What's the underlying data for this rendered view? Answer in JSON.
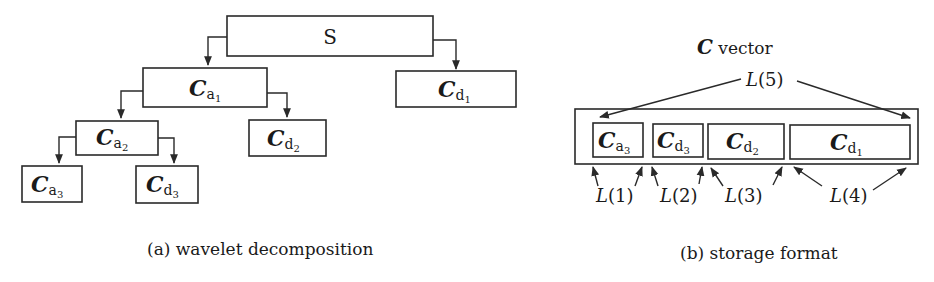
{
  "figure": {
    "panel_a": {
      "caption": "(a) wavelet decomposition",
      "nodes": [
        {
          "id": "S",
          "label": "S"
        },
        {
          "id": "Ca1",
          "sym": "C",
          "base": "a",
          "index": "1"
        },
        {
          "id": "Cd1",
          "sym": "C",
          "base": "d",
          "index": "1"
        },
        {
          "id": "Ca2",
          "sym": "C",
          "base": "a",
          "index": "2"
        },
        {
          "id": "Cd2",
          "sym": "C",
          "base": "d",
          "index": "2"
        },
        {
          "id": "Ca3",
          "sym": "C",
          "base": "a",
          "index": "3"
        },
        {
          "id": "Cd3",
          "sym": "C",
          "base": "d",
          "index": "3"
        }
      ],
      "edges": [
        [
          "S",
          "Ca1"
        ],
        [
          "S",
          "Cd1"
        ],
        [
          "Ca1",
          "Ca2"
        ],
        [
          "Ca1",
          "Cd2"
        ],
        [
          "Ca2",
          "Ca3"
        ],
        [
          "Ca2",
          "Cd3"
        ]
      ]
    },
    "panel_b": {
      "caption": "(b) storage format",
      "title_sym": "C",
      "title_text": " vector",
      "segments": [
        {
          "id": "Ca3",
          "sym": "C",
          "base": "a",
          "index": "3"
        },
        {
          "id": "Cd3",
          "sym": "C",
          "base": "d",
          "index": "3"
        },
        {
          "id": "Cd2",
          "sym": "C",
          "base": "d",
          "index": "2"
        },
        {
          "id": "Cd1",
          "sym": "C",
          "base": "d",
          "index": "1"
        }
      ],
      "length_labels": [
        {
          "fn": "L",
          "arg": "1"
        },
        {
          "fn": "L",
          "arg": "2"
        },
        {
          "fn": "L",
          "arg": "3"
        },
        {
          "fn": "L",
          "arg": "4"
        },
        {
          "fn": "L",
          "arg": "5"
        }
      ],
      "paren_open": "(",
      "paren_close": ")"
    }
  }
}
